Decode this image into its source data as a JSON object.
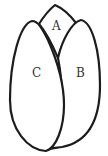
{
  "diagram": {
    "segments": [
      {
        "id": "A",
        "label": "A",
        "position": "top"
      },
      {
        "id": "B",
        "label": "B",
        "position": "right"
      },
      {
        "id": "C",
        "label": "C",
        "position": "left-front"
      }
    ],
    "colors": {
      "stroke": "#1c1c1c",
      "fill": "#ffffff",
      "label": "#333333"
    }
  }
}
